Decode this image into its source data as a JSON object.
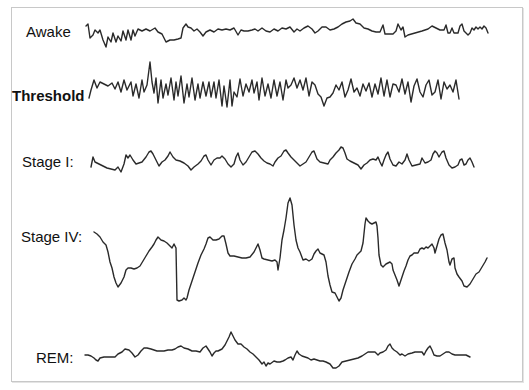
{
  "diagram": {
    "title": "",
    "stroke_color": "#2a2a2a",
    "frame_color": "#c8c8c8",
    "traces": [
      {
        "label": "Awake",
        "label_pos": [
          26,
          24
        ],
        "bold": false,
        "points": "86,26 88,24 90,38 93,35 95,30 98,33 100,30 103,40 106,47 108,37 111,42 113,33 116,42 118,36 121,41 123,31 126,40 128,30 131,40 133,30 135,36 138,29 142,31 146,29 150,31 155,28 158,32 162,34 166,42 170,40 174,40 178,39 181,38 183,28 186,24 188,27 191,28 194,31 197,29 200,32 203,36 206,32 210,30 214,32 218,29 222,30 226,29 230,30 234,28 238,35 241,30 244,31 248,31 252,30 255,29 258,31 262,28 266,31 270,32 274,29 278,31 282,28 286,29 290,27 294,32 297,29 300,31 304,28 308,26 312,29 315,33 318,31 322,27 326,27 330,30 334,29 338,27 342,24 346,22 350,21 353,19 356,23 360,24 364,28 368,29 372,31 376,32 380,32 383,25 385,34 389,34 393,34 396,31 398,24 401,30 403,27 405,37 408,35 422,31 428,29 432,26 436,28 440,30 444,30 446,25 448,33 450,33 452,28 454,33 458,33 460,26 462,24 464,31 466,33 468,35 470,33 472,28 474,30 476,27 478,29 480,27 482,29 484,26 486,28 488,33"
      },
      {
        "label": "Threshold",
        "label_pos": [
          12,
          88
        ],
        "bold": true,
        "points": "89,98 91,90 94,80 97,88 100,82 104,84 108,86 112,83 115,89 118,82 121,92 124,80 127,90 131,82 133,96 136,84 139,98 142,80 144,92 147,85 150,62 152,82 154,93 156,78 158,103 161,80 163,98 166,84 168,95 171,78 174,100 176,82 178,96 181,76 184,103 187,84 189,97 192,78 195,100 198,84 200,98 203,82 206,96 209,82 211,97 214,82 216,98 219,80 222,106 224,86 227,107 230,80 232,106 234,92 237,97 240,79 243,96 246,84 249,92 252,80 254,93 257,82 259,100 262,78 265,96 268,84 271,98 274,80 277,96 280,82 283,100 286,80 288,88 291,85 294,78 297,88 300,80 303,90 306,78 309,96 312,82 315,85 318,94 321,97 324,106 327,98 330,97 333,93 336,85 339,90 342,82 345,97 348,90 351,79 354,92 357,88 360,96 363,84 366,91 369,83 372,97 375,84 378,94 381,78 384,96 387,80 390,97 393,84 396,85 399,92 402,79 405,94 408,82 411,102 414,86 417,79 420,92 423,97 426,85 429,80 432,95 435,92 438,80 441,99 444,82 447,89 450,85 453,92 456,80 459,99"
      },
      {
        "label": "Stage I:",
        "label_pos": [
          22,
          156
        ],
        "bold": false,
        "points": "91,167 93,157 95,162 99,164 103,166 107,168 111,169 115,170 118,167 121,172 124,164 126,155 128,158 130,155 133,160 136,164 139,163 142,162 146,157 149,152 151,151 153,154 156,160 159,166 162,162 165,160 168,156 170,152 173,157 176,160 180,161 184,163 188,166 191,170 194,167 198,164 201,161 204,156 206,155 208,160 211,165 214,160 217,158 220,158 222,156 225,159 228,164 231,167 234,164 236,157 238,153 240,160 243,165 246,162 249,157 252,152 255,151 258,154 261,158 264,161 267,163 270,164 273,166 275,162 278,158 281,156 284,151 286,150 288,153 291,157 294,160 297,163 300,166 303,164 306,162 309,157 312,152 314,151 317,159 320,162 324,163 328,164 330,160 333,157 336,153 339,150 341,147 343,148 345,153 347,159 350,161 354,163 358,165 361,169 364,165 367,163 370,160 373,159 376,160 378,157 380,162 382,166 384,160 386,155 388,152 390,159 393,165 396,166 399,162 402,164 405,160 407,154 409,160 412,166 416,165 420,164 422,158 425,163 428,162 431,160 433,154 435,151 437,153 439,157 442,152 444,151 446,158 449,165 452,168 455,167 458,165 460,160 462,159 464,165 466,164 468,160 470,158 472,162 474,167"
      },
      {
        "label": "Stage IV:",
        "label_pos": [
          21,
          230
        ],
        "bold": false,
        "points": "94,232 97,234 100,237 103,242 106,245 108,252 110,262 112,268 114,277 116,283 118,287 121,283 124,277 126,270 128,268 131,268 134,269 137,268 140,266 143,261 146,256 149,251 152,247 154,244 156,240 158,237 161,240 164,241 167,243 170,246 172,248 174,244 176,248 177,300 179,301 182,300 184,298 186,300 187,298 189,290 192,281 195,272 198,263 201,255 204,249 206,244 208,238 210,237 213,240 216,240 219,239 222,236 224,236 226,244 228,253 230,256 234,256 238,257 242,258 246,258 250,257 254,252 256,248 258,244 260,250 262,258 264,259 268,260 272,261 275,260 277,262 278,270 280,258 282,240 284,230 286,218 288,203 290,198 292,205 294,225 296,240 298,248 300,252 303,260 306,259 309,261 312,259 314,254 316,251 318,249 320,253 322,254 324,255 326,262 328,276 330,285 332,292 335,293 337,297 339,301 341,298 343,290 346,281 349,272 352,264 355,259 357,255 359,253 361,251 363,243 365,224 366,218 368,221 370,223 372,224 374,223 376,222 377,226 378,238 379,255 381,265 383,267 386,264 388,263 390,262 392,264 393,270 395,275 397,280 399,286 400,283 402,277 404,271 406,266 408,260 410,256 412,255 414,253 416,253 418,253 420,249 422,248 424,249 426,247 428,248 430,246 432,244 434,248 435,253 437,246 439,239 441,235 443,234 445,243 447,250 449,262 450,265 452,259 454,258 455,268 457,274 459,277 462,281 464,286 467,287 470,284 473,279 476,274 479,272 482,267 485,262 487,258"
      },
      {
        "label": "REM:",
        "label_pos": [
          36,
          350
        ],
        "bold": false,
        "points": "85,355 88,355 91,356 94,358 96,360 98,361 100,358 104,357 108,357 112,357 115,357 118,354 122,352 125,349 129,350 132,353 135,357 138,355 141,351 144,348 147,348 151,349 154,350 157,351 160,351 164,351 168,350 172,350 175,349 178,347 181,346 184,348 188,349 192,351 196,351 200,352 203,348 206,346 208,349 210,352 212,356 214,353 216,351 218,351 222,349 225,345 227,341 229,337 231,332 233,336 235,340 238,344 241,344 244,347 247,349 250,352 253,354 256,357 259,360 262,364 264,362 266,366 268,363 270,364 274,361 277,362 280,362 283,361 285,360 288,358 291,357 293,360 295,355 297,351 299,354 302,356 305,357 308,358 311,360 314,359 317,360 320,361 323,361 326,362 330,364 333,368 336,368 339,366 342,362 346,361 350,360 354,359 358,358 362,356 365,354 368,352 371,352 375,352 378,355 380,353 383,352 386,350 388,346 390,344 392,348 394,350 397,352 400,355 402,354 405,356 408,354 412,353 415,352 418,352 422,352 424,355 426,351 428,348 430,346 432,350 434,355 437,356 440,356 443,354 446,352 449,352 452,354 455,355 458,355 461,355 464,355 466,355 470,357"
      }
    ]
  }
}
